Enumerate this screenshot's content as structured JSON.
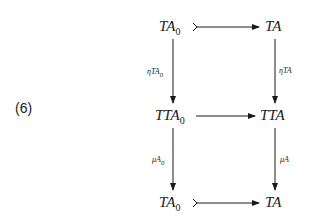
{
  "equation_number": "(6)",
  "nodes": {
    "top_left": {
      "base": "TA",
      "sub": "0"
    },
    "top_right": {
      "base": "TA",
      "sub": ""
    },
    "mid_left": {
      "base": "TTA",
      "sub": "0"
    },
    "mid_right": {
      "base": "TTA",
      "sub": ""
    },
    "bot_left": {
      "base": "TA",
      "sub": "0"
    },
    "bot_right": {
      "base": "TA",
      "sub": ""
    }
  },
  "labels": {
    "eta_left": {
      "text": "ηTA",
      "sub": "0"
    },
    "eta_right": {
      "text": "ηTA",
      "sub": ""
    },
    "mu_left": {
      "text": "μA",
      "sub": "0"
    },
    "mu_right": {
      "text": "μA",
      "sub": ""
    }
  }
}
